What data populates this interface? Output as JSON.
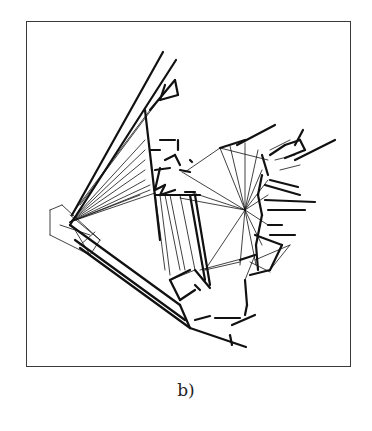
{
  "figure": {
    "caption": "b)",
    "frame": {
      "x": 26,
      "y": 21,
      "width": 325,
      "height": 346
    },
    "colors": {
      "background": "#ffffff",
      "ink": "#111111",
      "frame": "#3a3a3a"
    },
    "thick_segments": [
      [
        163,
        52,
        72,
        215
      ],
      [
        176,
        60,
        70,
        225
      ],
      [
        145,
        110,
        160,
        240
      ],
      [
        150,
        110,
        175,
        80
      ],
      [
        175,
        80,
        178,
        95
      ],
      [
        178,
        95,
        160,
        100
      ],
      [
        160,
        100,
        165,
        85
      ],
      [
        70,
        225,
        180,
        305
      ],
      [
        75,
        240,
        185,
        320
      ],
      [
        80,
        248,
        190,
        328
      ],
      [
        180,
        305,
        190,
        328
      ],
      [
        190,
        328,
        246,
        347
      ],
      [
        230,
        335,
        232,
        345
      ],
      [
        160,
        140,
        175,
        140
      ],
      [
        178,
        140,
        178,
        150
      ],
      [
        150,
        150,
        160,
        150
      ],
      [
        165,
        160,
        175,
        155
      ],
      [
        175,
        155,
        180,
        165
      ],
      [
        190,
        160,
        192,
        162
      ],
      [
        180,
        170,
        190,
        172
      ],
      [
        155,
        170,
        170,
        168
      ],
      [
        160,
        168,
        155,
        190
      ],
      [
        155,
        190,
        165,
        185
      ],
      [
        165,
        185,
        160,
        195
      ],
      [
        160,
        195,
        175,
        190
      ],
      [
        155,
        195,
        200,
        195
      ],
      [
        185,
        192,
        195,
        192
      ],
      [
        190,
        195,
        205,
        280
      ],
      [
        195,
        195,
        210,
        285
      ],
      [
        170,
        280,
        190,
        270
      ],
      [
        195,
        270,
        210,
        288
      ],
      [
        195,
        285,
        200,
        290
      ],
      [
        170,
        280,
        180,
        300
      ],
      [
        180,
        300,
        195,
        290
      ],
      [
        245,
        280,
        247,
        305
      ],
      [
        247,
        305,
        245,
        315
      ],
      [
        237,
        145,
        275,
        125
      ],
      [
        220,
        148,
        245,
        140
      ],
      [
        270,
        155,
        285,
        145
      ],
      [
        285,
        145,
        300,
        140
      ],
      [
        300,
        140,
        305,
        150
      ],
      [
        305,
        150,
        285,
        158
      ],
      [
        295,
        160,
        335,
        140
      ],
      [
        295,
        145,
        303,
        130
      ],
      [
        270,
        180,
        298,
        187
      ],
      [
        265,
        185,
        300,
        195
      ],
      [
        265,
        200,
        315,
        202
      ],
      [
        268,
        210,
        305,
        210
      ],
      [
        268,
        225,
        282,
        225
      ],
      [
        270,
        235,
        295,
        235
      ],
      [
        255,
        235,
        282,
        245
      ],
      [
        282,
        245,
        270,
        270
      ],
      [
        270,
        270,
        250,
        275
      ],
      [
        240,
        260,
        255,
        255
      ],
      [
        195,
        320,
        210,
        316
      ],
      [
        215,
        318,
        240,
        318
      ],
      [
        232,
        325,
        255,
        315
      ],
      [
        262,
        155,
        268,
        175
      ],
      [
        262,
        175,
        258,
        195
      ],
      [
        258,
        195,
        262,
        215
      ],
      [
        262,
        215,
        256,
        245
      ],
      [
        256,
        245,
        258,
        270
      ]
    ],
    "thin_segments": [
      [
        70,
        222,
        145,
        140
      ],
      [
        70,
        222,
        145,
        150
      ],
      [
        70,
        222,
        145,
        160
      ],
      [
        70,
        222,
        145,
        170
      ],
      [
        70,
        222,
        145,
        180
      ],
      [
        70,
        222,
        150,
        185
      ],
      [
        70,
        222,
        150,
        190
      ],
      [
        70,
        222,
        155,
        193
      ],
      [
        70,
        222,
        140,
        195
      ],
      [
        150,
        110,
        75,
        210
      ],
      [
        155,
        105,
        80,
        205
      ],
      [
        245,
        210,
        220,
        148
      ],
      [
        245,
        210,
        230,
        146
      ],
      [
        245,
        210,
        245,
        143
      ],
      [
        245,
        210,
        258,
        150
      ],
      [
        245,
        210,
        262,
        170
      ],
      [
        245,
        210,
        268,
        180
      ],
      [
        245,
        210,
        268,
        195
      ],
      [
        245,
        210,
        268,
        225
      ],
      [
        245,
        210,
        262,
        245
      ],
      [
        245,
        210,
        256,
        265
      ],
      [
        245,
        210,
        240,
        265
      ],
      [
        245,
        210,
        205,
        270
      ],
      [
        245,
        210,
        180,
        198
      ],
      [
        245,
        210,
        190,
        192
      ],
      [
        245,
        210,
        182,
        172
      ],
      [
        220,
        148,
        185,
        172
      ],
      [
        220,
        148,
        268,
        160
      ],
      [
        205,
        270,
        240,
        262
      ],
      [
        170,
        280,
        195,
        270
      ],
      [
        200,
        270,
        245,
        258
      ],
      [
        155,
        193,
        165,
        270
      ],
      [
        160,
        195,
        170,
        275
      ],
      [
        165,
        195,
        180,
        270
      ],
      [
        170,
        195,
        185,
        270
      ],
      [
        195,
        195,
        210,
        285
      ],
      [
        180,
        195,
        195,
        270
      ],
      [
        50,
        210,
        62,
        205
      ],
      [
        62,
        205,
        100,
        240
      ],
      [
        100,
        240,
        90,
        255
      ],
      [
        90,
        255,
        50,
        235
      ],
      [
        50,
        235,
        50,
        210
      ],
      [
        60,
        225,
        90,
        235
      ],
      [
        70,
        215,
        100,
        240
      ],
      [
        75,
        230,
        90,
        255
      ],
      [
        80,
        245,
        95,
        232
      ],
      [
        270,
        150,
        290,
        140
      ],
      [
        275,
        160,
        295,
        155
      ],
      [
        280,
        170,
        300,
        165
      ],
      [
        255,
        260,
        290,
        245
      ],
      [
        270,
        270,
        290,
        245
      ],
      [
        255,
        255,
        245,
        280
      ],
      [
        250,
        262,
        270,
        272
      ]
    ],
    "dashed_segments": [
      [
        160,
        140,
        175,
        140
      ],
      [
        195,
        320,
        205,
        316
      ],
      [
        212,
        318,
        237,
        318
      ],
      [
        232,
        325,
        255,
        315
      ]
    ]
  }
}
